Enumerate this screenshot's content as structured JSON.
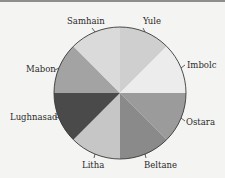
{
  "chart_data": {
    "type": "pie",
    "title": "",
    "start_angle_deg": 0,
    "direction": "clockwise",
    "categories": [
      "Yule",
      "Imbolc",
      "Ostara",
      "Beltane",
      "Litha",
      "Lughnasad",
      "Mabon",
      "Samhain"
    ],
    "values": [
      12.5,
      12.5,
      12.5,
      12.5,
      12.5,
      12.5,
      12.5,
      12.5
    ],
    "colors": [
      "#cfcfcf",
      "#ececec",
      "#9b9b9b",
      "#8a8a8a",
      "#c6c6c6",
      "#4a4a4a",
      "#a3a3a3",
      "#dadada"
    ],
    "legend": "none",
    "labels_outside": true
  },
  "labels": {
    "yule": "Yule",
    "imbolc": "Imbolc",
    "ostara": "Ostara",
    "beltane": "Beltane",
    "litha": "Litha",
    "lughnasad": "Lughnasad",
    "mabon": "Mabon",
    "samhain": "Samhain"
  }
}
